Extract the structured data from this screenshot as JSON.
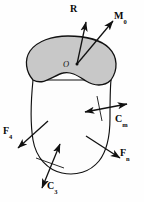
{
  "figure": {
    "type": "free-body-diagram",
    "background_color": "#fefefe",
    "line_color": "#111111",
    "section_fill_color": "#c8c8c8",
    "body_fill_color": "#fdfdfd"
  },
  "point_labels": [
    {
      "id": "O",
      "text": "O",
      "style": "italic"
    }
  ],
  "vectors": [
    {
      "id": "R",
      "base": "R",
      "subscript": "",
      "kind": "force",
      "arrowheads": 1,
      "origin": "O",
      "direction": "up-slightly-right"
    },
    {
      "id": "M0",
      "base": "M",
      "subscript": "0",
      "kind": "moment",
      "arrowheads": 1,
      "origin": "O",
      "direction": "up-right"
    },
    {
      "id": "Cm",
      "base": "C",
      "subscript": "m",
      "kind": "couple",
      "arrowheads": 2,
      "origin": "body-right",
      "direction": "right"
    },
    {
      "id": "Fn",
      "base": "F",
      "subscript": "n",
      "kind": "force",
      "arrowheads": 1,
      "origin": "body-lower-right",
      "direction": "down-right"
    },
    {
      "id": "F4",
      "base": "F",
      "subscript": "4",
      "kind": "force",
      "arrowheads": 1,
      "origin": "body-left",
      "direction": "down-left"
    },
    {
      "id": "C3",
      "base": "C",
      "subscript": "3",
      "kind": "couple",
      "arrowheads": 2,
      "origin": "body-bottom",
      "direction": "down-left"
    }
  ]
}
